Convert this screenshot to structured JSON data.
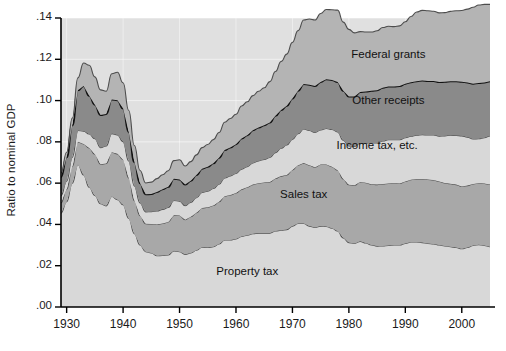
{
  "chart_data": {
    "type": "area",
    "stacked": true,
    "title": "",
    "subtitle": "",
    "xlabel": "",
    "ylabel": "Ratio to nominal GDP",
    "xlim": [
      1929,
      2005
    ],
    "ylim": [
      0.0,
      0.14
    ],
    "grid": true,
    "grid_color": "#ffffff",
    "legend_position": "inline-annotations",
    "x_ticks": [
      1930,
      1940,
      1950,
      1960,
      1970,
      1980,
      1990,
      2000
    ],
    "x_tick_labels": [
      "1930",
      "1940",
      "1950",
      "1960",
      "1970",
      "1980",
      "1990",
      "2000"
    ],
    "y_ticks": [
      0.0,
      0.02,
      0.04,
      0.06,
      0.08,
      0.1,
      0.12,
      0.14
    ],
    "y_tick_labels": [
      ".00",
      ".02",
      ".04",
      ".06",
      ".08",
      ".10",
      ".12",
      ".14"
    ],
    "x": [
      1929,
      1930,
      1931,
      1932,
      1933,
      1934,
      1935,
      1936,
      1937,
      1938,
      1939,
      1940,
      1941,
      1942,
      1943,
      1944,
      1945,
      1946,
      1947,
      1948,
      1949,
      1950,
      1951,
      1952,
      1953,
      1954,
      1955,
      1956,
      1957,
      1958,
      1959,
      1960,
      1961,
      1962,
      1963,
      1964,
      1965,
      1966,
      1967,
      1968,
      1969,
      1970,
      1971,
      1972,
      1973,
      1974,
      1975,
      1976,
      1977,
      1978,
      1979,
      1980,
      1981,
      1982,
      1983,
      1984,
      1985,
      1986,
      1987,
      1988,
      1989,
      1990,
      1991,
      1992,
      1993,
      1994,
      1995,
      1996,
      1997,
      1998,
      1999,
      2000,
      2001,
      2002,
      2003,
      2004,
      2005
    ],
    "series": [
      {
        "name": "Property tax",
        "color": "#d8d8d8",
        "values": [
          0.0455,
          0.051,
          0.06,
          0.069,
          0.064,
          0.058,
          0.054,
          0.05,
          0.049,
          0.0535,
          0.052,
          0.0495,
          0.043,
          0.0355,
          0.03,
          0.0268,
          0.0262,
          0.0248,
          0.025,
          0.0252,
          0.0272,
          0.0268,
          0.0255,
          0.0262,
          0.0275,
          0.029,
          0.0288,
          0.0292,
          0.0305,
          0.0325,
          0.0325,
          0.033,
          0.0342,
          0.0348,
          0.0355,
          0.0358,
          0.0358,
          0.0358,
          0.0368,
          0.0372,
          0.0375,
          0.0392,
          0.0405,
          0.0405,
          0.0392,
          0.0385,
          0.0392,
          0.039,
          0.0382,
          0.0368,
          0.0335,
          0.0312,
          0.0308,
          0.0318,
          0.031,
          0.03,
          0.0295,
          0.0296,
          0.0298,
          0.03,
          0.03,
          0.0308,
          0.0315,
          0.0315,
          0.0312,
          0.0308,
          0.0305,
          0.03,
          0.0296,
          0.0292,
          0.0288,
          0.0282,
          0.0288,
          0.0298,
          0.0302,
          0.0298,
          0.0292
        ]
      },
      {
        "name": "Sales tax",
        "color": "#a8a8a8",
        "values": [
          0.005,
          0.006,
          0.008,
          0.011,
          0.015,
          0.019,
          0.02,
          0.0192,
          0.0205,
          0.0215,
          0.0222,
          0.0218,
          0.0195,
          0.016,
          0.0142,
          0.0135,
          0.014,
          0.0152,
          0.0155,
          0.016,
          0.0172,
          0.0175,
          0.0168,
          0.0175,
          0.0182,
          0.019,
          0.0195,
          0.02,
          0.0205,
          0.0212,
          0.0218,
          0.0222,
          0.0228,
          0.0232,
          0.0238,
          0.0242,
          0.0245,
          0.0248,
          0.0255,
          0.0262,
          0.0265,
          0.0272,
          0.0282,
          0.0292,
          0.0295,
          0.0292,
          0.0298,
          0.03,
          0.0298,
          0.0295,
          0.0285,
          0.028,
          0.0282,
          0.0288,
          0.0292,
          0.0295,
          0.0298,
          0.03,
          0.03,
          0.03,
          0.0298,
          0.03,
          0.0302,
          0.0305,
          0.0308,
          0.031,
          0.031,
          0.0308,
          0.0305,
          0.0305,
          0.0305,
          0.0302,
          0.03,
          0.0298,
          0.0298,
          0.03,
          0.0302
        ]
      },
      {
        "name": "Income tax, etc.",
        "color": "#d8d8d8",
        "values": [
          0.0035,
          0.004,
          0.0045,
          0.0055,
          0.0062,
          0.0068,
          0.0075,
          0.008,
          0.0085,
          0.009,
          0.0092,
          0.0088,
          0.0082,
          0.0072,
          0.0062,
          0.0058,
          0.006,
          0.0065,
          0.0068,
          0.007,
          0.0072,
          0.007,
          0.0068,
          0.007,
          0.0072,
          0.0075,
          0.0078,
          0.0082,
          0.0085,
          0.0088,
          0.0092,
          0.0095,
          0.0098,
          0.01,
          0.0105,
          0.0108,
          0.0112,
          0.0118,
          0.0125,
          0.0135,
          0.0145,
          0.0148,
          0.0152,
          0.0165,
          0.0168,
          0.0168,
          0.0168,
          0.0175,
          0.018,
          0.0185,
          0.0188,
          0.0188,
          0.0188,
          0.0188,
          0.0192,
          0.02,
          0.0202,
          0.0208,
          0.0212,
          0.021,
          0.0212,
          0.0212,
          0.021,
          0.0212,
          0.0215,
          0.0215,
          0.0218,
          0.022,
          0.0228,
          0.0235,
          0.0238,
          0.0245,
          0.0235,
          0.0218,
          0.0215,
          0.0222,
          0.0235
        ]
      },
      {
        "name": "Other receipts",
        "color": "#8a8a8a",
        "values": [
          0.009,
          0.0115,
          0.0155,
          0.0195,
          0.0218,
          0.0185,
          0.0165,
          0.0158,
          0.0155,
          0.0165,
          0.0168,
          0.016,
          0.014,
          0.0115,
          0.0095,
          0.0085,
          0.0085,
          0.0092,
          0.0098,
          0.01,
          0.0105,
          0.0105,
          0.0102,
          0.0105,
          0.011,
          0.0115,
          0.0118,
          0.0122,
          0.0128,
          0.0135,
          0.0138,
          0.0142,
          0.0148,
          0.0152,
          0.0158,
          0.0162,
          0.0165,
          0.017,
          0.0178,
          0.0185,
          0.019,
          0.0198,
          0.0208,
          0.0218,
          0.0222,
          0.0225,
          0.0232,
          0.0238,
          0.024,
          0.0242,
          0.024,
          0.024,
          0.0242,
          0.0248,
          0.025,
          0.0252,
          0.0255,
          0.0258,
          0.0258,
          0.0258,
          0.026,
          0.0262,
          0.0262,
          0.0262,
          0.0262,
          0.0262,
          0.0262,
          0.0262,
          0.0262,
          0.0262,
          0.0262,
          0.0262,
          0.0265,
          0.0268,
          0.027,
          0.0268,
          0.0265
        ]
      },
      {
        "name": "Federal grants",
        "color": "#b4b4b4",
        "values": [
          0.002,
          0.0025,
          0.0035,
          0.006,
          0.0112,
          0.0148,
          0.0135,
          0.0122,
          0.011,
          0.0125,
          0.0135,
          0.0125,
          0.0105,
          0.008,
          0.0062,
          0.0055,
          0.0058,
          0.0065,
          0.007,
          0.0078,
          0.0088,
          0.0095,
          0.009,
          0.0092,
          0.0098,
          0.0102,
          0.0108,
          0.0115,
          0.0122,
          0.0135,
          0.014,
          0.0145,
          0.0158,
          0.0162,
          0.0168,
          0.0175,
          0.0182,
          0.0198,
          0.0215,
          0.0235,
          0.025,
          0.0272,
          0.0292,
          0.031,
          0.0318,
          0.032,
          0.0332,
          0.0338,
          0.034,
          0.0348,
          0.0332,
          0.0325,
          0.0308,
          0.0292,
          0.0288,
          0.0285,
          0.0288,
          0.0292,
          0.0292,
          0.029,
          0.0292,
          0.03,
          0.0318,
          0.0335,
          0.034,
          0.034,
          0.0338,
          0.0335,
          0.0335,
          0.0338,
          0.0342,
          0.0345,
          0.0355,
          0.037,
          0.0378,
          0.0378,
          0.0372
        ]
      }
    ],
    "annotations": [
      {
        "text": "Federal grants",
        "x": 1987,
        "y": 0.1215
      },
      {
        "text": "Other receipts",
        "x": 1987,
        "y": 0.0995
      },
      {
        "text": "Income tax, etc.",
        "x": 1985,
        "y": 0.0775
      },
      {
        "text": "Sales tax",
        "x": 1972,
        "y": 0.054
      },
      {
        "text": "Property tax",
        "x": 1962,
        "y": 0.0165
      }
    ]
  },
  "style": {
    "plot_background": "#e0e0e0",
    "axis_color": "#000000",
    "band_outline_dark": "#111111",
    "band_outline_light": "#4d4d4d"
  }
}
